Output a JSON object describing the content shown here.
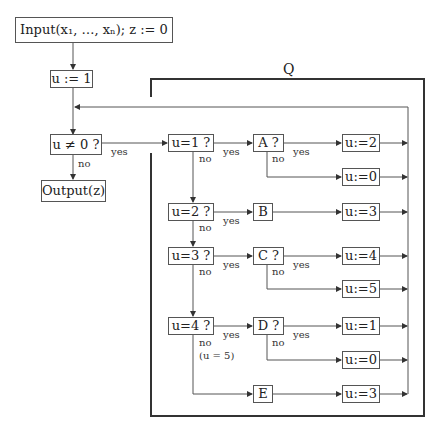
{
  "diagram": {
    "title_region_label": "Q",
    "nodes": {
      "input": "Input(x₁, …, xₙ);  z := 0",
      "init_u": "u := 1",
      "test_u_nonzero": "u ≠ 0 ?",
      "output": "Output(z)",
      "test_u1": "u=1 ?",
      "test_u2": "u=2 ?",
      "test_u3": "u=3 ?",
      "test_u4": "u=4 ?",
      "test_A": "A ?",
      "op_B": "B",
      "test_C": "C ?",
      "test_D": "D ?",
      "op_E": "E",
      "assign_A_yes": "u:=2",
      "assign_A_no": "u:=0",
      "assign_B": "u:=3",
      "assign_C_yes": "u:=4",
      "assign_C_no": "u:=5",
      "assign_D_yes": "u:=1",
      "assign_D_no": "u:=0",
      "assign_E": "u:=3"
    },
    "edge_labels": {
      "yes": "yes",
      "no": "no",
      "u4_no_note": "(u = 5)"
    },
    "edges": [
      {
        "from": "input",
        "to": "init_u"
      },
      {
        "from": "init_u",
        "to": "test_u_nonzero"
      },
      {
        "from": "test_u_nonzero",
        "to": "test_u1",
        "label": "yes"
      },
      {
        "from": "test_u_nonzero",
        "to": "output",
        "label": "no"
      },
      {
        "from": "test_u1",
        "to": "test_A",
        "label": "yes"
      },
      {
        "from": "test_u1",
        "to": "test_u2",
        "label": "no"
      },
      {
        "from": "test_A",
        "to": "assign_A_yes",
        "label": "yes"
      },
      {
        "from": "test_A",
        "to": "assign_A_no",
        "label": "no"
      },
      {
        "from": "test_u2",
        "to": "op_B",
        "label": "yes"
      },
      {
        "from": "test_u2",
        "to": "test_u3",
        "label": "no"
      },
      {
        "from": "op_B",
        "to": "assign_B"
      },
      {
        "from": "test_u3",
        "to": "test_C",
        "label": "yes"
      },
      {
        "from": "test_u3",
        "to": "test_u4",
        "label": "no"
      },
      {
        "from": "test_C",
        "to": "assign_C_yes",
        "label": "yes"
      },
      {
        "from": "test_C",
        "to": "assign_C_no",
        "label": "no"
      },
      {
        "from": "test_u4",
        "to": "test_D",
        "label": "yes"
      },
      {
        "from": "test_u4",
        "to": "op_E",
        "label": "no (u = 5)"
      },
      {
        "from": "test_D",
        "to": "assign_D_yes",
        "label": "yes"
      },
      {
        "from": "test_D",
        "to": "assign_D_no",
        "label": "no"
      },
      {
        "from": "op_E",
        "to": "assign_E"
      },
      {
        "from": "all assignments",
        "to": "test_u_nonzero",
        "label": "loop back"
      }
    ]
  }
}
